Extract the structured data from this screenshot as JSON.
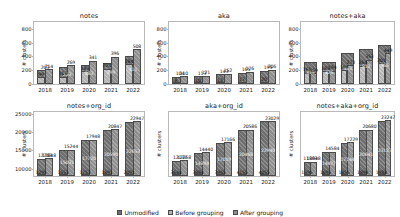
{
  "chart_data": [
    {
      "type": "bar",
      "title": "notes",
      "xlabel": "",
      "ylabel": "# clusters",
      "categories": [
        "2018",
        "2019",
        "2020",
        "2021",
        "2022"
      ],
      "yticks": [
        0,
        200,
        400,
        600,
        800
      ],
      "ylim": [
        0,
        900
      ],
      "grid": false,
      "series": [
        {
          "name": "Unmodified",
          "values": [
            203,
            253,
            283,
            299,
            411
          ]
        },
        {
          "name": "Before grouping",
          "values": [
            99,
            108,
            183,
            221,
            284
          ]
        },
        {
          "name": "After grouping",
          "values": [
            214,
            269,
            341,
            396,
            508
          ]
        }
      ]
    },
    {
      "type": "bar",
      "title": "aka",
      "xlabel": "",
      "ylabel": "# clusters",
      "categories": [
        "2018",
        "2019",
        "2020",
        "2021",
        "2022"
      ],
      "yticks": [
        0,
        200,
        400,
        600,
        800
      ],
      "ylim": [
        0,
        900
      ],
      "grid": false,
      "series": [
        {
          "name": "Unmodified",
          "values": [
            104,
            113,
            143,
            165,
            195
          ]
        },
        {
          "name": "Before grouping",
          "values": [
            8,
            10,
            12,
            17,
            20
          ]
        },
        {
          "name": "After grouping",
          "values": [
            110,
            121,
            152,
            176,
            206
          ]
        }
      ]
    },
    {
      "type": "bar",
      "title": "notes+aka",
      "xlabel": "",
      "ylabel": "# clusters",
      "categories": [
        "2018",
        "2019",
        "2020",
        "2021",
        "2022"
      ],
      "yticks": [
        0,
        200,
        400,
        600,
        800
      ],
      "ylim": [
        0,
        900
      ],
      "grid": false,
      "series": [
        {
          "name": "Unmodified",
          "values": [
            313,
            326,
            443,
            512,
            565
          ]
        },
        {
          "name": "Before grouping",
          "values": [
            161,
            185,
            199,
            264,
            301
          ]
        },
        {
          "name": "After grouping",
          "values": [
            159,
            194,
            273,
            353,
            449
          ]
        }
      ]
    },
    {
      "type": "bar",
      "title": "notes+org_id",
      "xlabel": "",
      "ylabel": "# clusters",
      "categories": [
        "2018",
        "2019",
        "2020",
        "2021",
        "2022"
      ],
      "yticks": [
        10000,
        15000,
        20000,
        25000
      ],
      "ylim": [
        8000,
        25500
      ],
      "grid": false,
      "series": [
        {
          "name": "Unmodified",
          "values": [
            12703,
            15031,
            17720,
            20590,
            22653
          ]
        },
        {
          "name": "Before grouping",
          "values": [
            1295,
            1553,
            1753,
            1891,
            2091
          ]
        },
        {
          "name": "After grouping",
          "values": [
            12848,
            15244,
            17948,
            20847,
            22947
          ]
        }
      ]
    },
    {
      "type": "bar",
      "title": "aka+org_id",
      "xlabel": "",
      "ylabel": "# clusters",
      "categories": [
        "2018",
        "2019",
        "2020",
        "2021",
        "2022"
      ],
      "yticks": [],
      "ylim": [
        8000,
        25500
      ],
      "grid": false,
      "series": [
        {
          "name": "Unmodified",
          "values": [
            12137,
            14394,
            17019,
            20468,
            22940
          ]
        },
        {
          "name": "Before grouping",
          "values": [
            3644,
            3884,
            3965,
            4155,
            4055
          ]
        },
        {
          "name": "After grouping",
          "values": [
            12268,
            14440,
            17166,
            20586,
            23029
          ]
        }
      ]
    },
    {
      "type": "bar",
      "title": "notes+aka+org_id",
      "xlabel": "",
      "ylabel": "# clusters",
      "categories": [
        "2018",
        "2019",
        "2020",
        "2021",
        "2022"
      ],
      "yticks": [],
      "ylim": [
        8000,
        25500
      ],
      "grid": false,
      "series": [
        {
          "name": "Unmodified",
          "values": [
            11863,
            14477,
            17144,
            20641,
            23127
          ]
        },
        {
          "name": "Before grouping",
          "values": [
            1395,
            1695,
            1855,
            1898,
            1988
          ]
        },
        {
          "name": "After grouping",
          "values": [
            11948,
            14584,
            17229,
            20680,
            23247
          ]
        }
      ]
    }
  ],
  "legend": {
    "position": "bottom-center",
    "items": [
      {
        "label": "Unmodified",
        "color": "#6e6e6e"
      },
      {
        "label": "Before grouping",
        "color": "#b4b4b4"
      },
      {
        "label": "After grouping",
        "color": "#8e8e8e"
      }
    ]
  }
}
